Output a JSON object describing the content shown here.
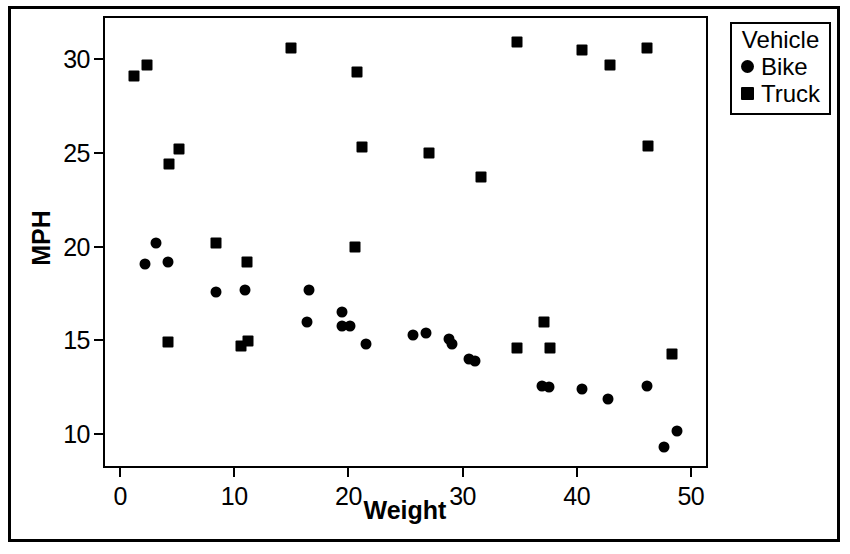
{
  "chart_data": {
    "type": "scatter",
    "title": "",
    "xlabel": "Weight",
    "ylabel": "MPH",
    "xlim": [
      -1.5,
      51.5
    ],
    "ylim": [
      8.2,
      32.3
    ],
    "xticks": [
      0,
      10,
      20,
      30,
      40,
      50
    ],
    "yticks": [
      10,
      15,
      20,
      25,
      30
    ],
    "grid": false,
    "legend": {
      "title": "Vehicle",
      "position": "outside-top-right",
      "entries": [
        {
          "label": "Bike",
          "marker": "circle",
          "color": "#000000"
        },
        {
          "label": "Truck",
          "marker": "square",
          "color": "#000000"
        }
      ]
    },
    "series": [
      {
        "name": "Bike",
        "marker": "circle",
        "color": "#000000",
        "points": [
          [
            2.0,
            19.2
          ],
          [
            3.0,
            20.3
          ],
          [
            4.0,
            19.3
          ],
          [
            8.2,
            17.7
          ],
          [
            10.8,
            17.8
          ],
          [
            16.4,
            17.8
          ],
          [
            16.2,
            16.1
          ],
          [
            19.3,
            16.6
          ],
          [
            19.3,
            15.9
          ],
          [
            20.0,
            15.9
          ],
          [
            21.4,
            14.9
          ],
          [
            25.5,
            15.4
          ],
          [
            26.6,
            15.5
          ],
          [
            28.6,
            15.2
          ],
          [
            28.9,
            14.9
          ],
          [
            30.4,
            14.1
          ],
          [
            30.9,
            14.0
          ],
          [
            36.8,
            12.7
          ],
          [
            37.4,
            12.6
          ],
          [
            40.3,
            12.5
          ],
          [
            42.6,
            12.0
          ],
          [
            46.0,
            12.7
          ],
          [
            47.5,
            9.4
          ],
          [
            48.6,
            10.3
          ]
        ]
      },
      {
        "name": "Truck",
        "marker": "square",
        "color": "#000000",
        "points": [
          [
            1.0,
            29.2
          ],
          [
            2.2,
            29.8
          ],
          [
            4.1,
            24.5
          ],
          [
            5.0,
            25.3
          ],
          [
            4.0,
            15.0
          ],
          [
            8.2,
            20.3
          ],
          [
            10.9,
            19.3
          ],
          [
            10.4,
            14.8
          ],
          [
            11.0,
            15.1
          ],
          [
            14.8,
            30.7
          ],
          [
            20.6,
            29.4
          ],
          [
            21.0,
            25.4
          ],
          [
            20.4,
            20.1
          ],
          [
            26.9,
            25.1
          ],
          [
            31.4,
            23.8
          ],
          [
            34.6,
            31.0
          ],
          [
            34.6,
            14.7
          ],
          [
            37.0,
            16.1
          ],
          [
            37.5,
            14.7
          ],
          [
            40.3,
            30.6
          ],
          [
            42.7,
            29.8
          ],
          [
            46.0,
            30.7
          ],
          [
            46.1,
            25.5
          ],
          [
            48.2,
            14.4
          ]
        ]
      }
    ]
  }
}
